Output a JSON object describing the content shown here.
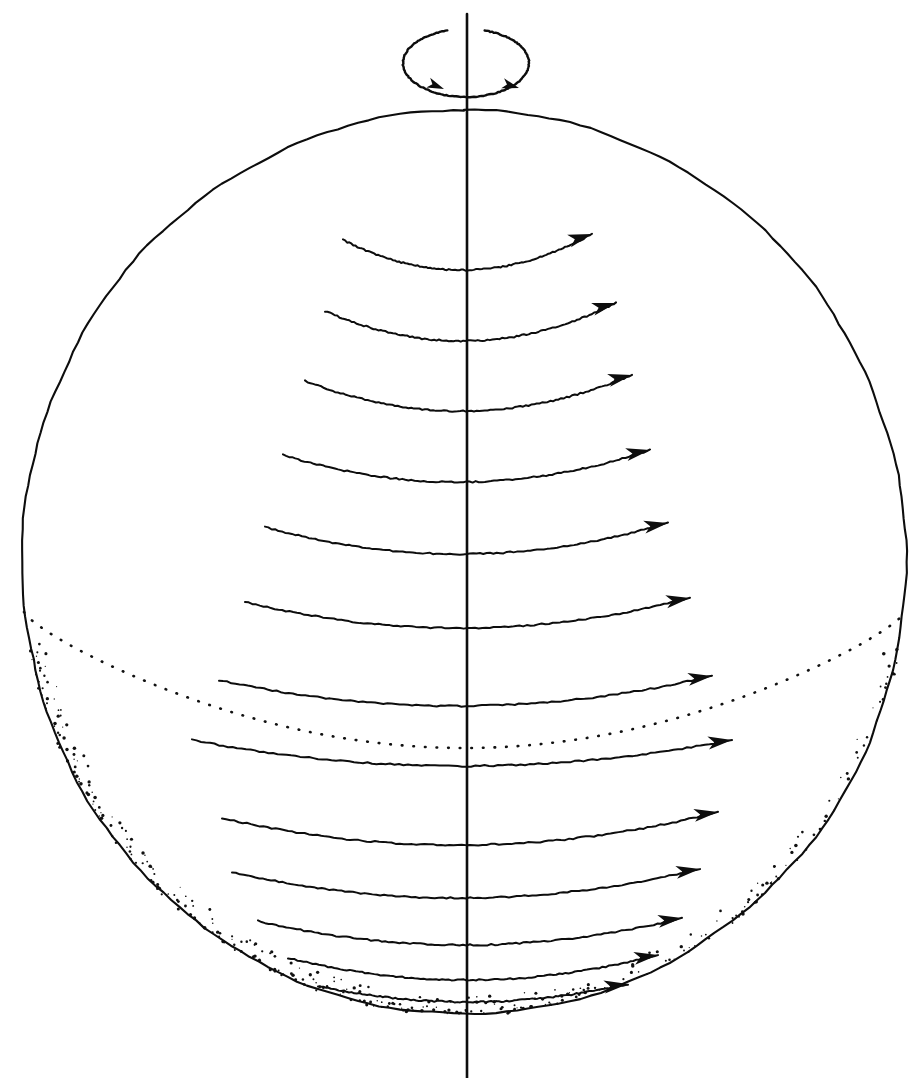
{
  "figure": {
    "title": "Rotating sphere with zonal (west-to-east) flow bands",
    "background_color": "#ffffff",
    "ink_color": "#0d0d0d",
    "width": 921,
    "height": 1078,
    "style": "hand-drawn line illustration"
  },
  "sphere": {
    "name": "sphere-outline",
    "center_x": 464,
    "center_y": 562,
    "radius_x": 442,
    "radius_y": 452,
    "top_y": 110,
    "bottom_y": 1014,
    "left_x": 22,
    "right_x": 906,
    "stroke_width": 2.1
  },
  "axis": {
    "name": "rotation-axis",
    "x": 467,
    "top_y": 14,
    "bottom_y": 1078,
    "label": "rotation axis"
  },
  "rotation_indicator": {
    "name": "rotation-ellipse",
    "center_x": 466,
    "center_y": 63,
    "radius_x": 63,
    "radius_y": 34,
    "direction": "counterclockwise-viewed-from-north",
    "arrow_count": 2,
    "arrows": [
      {
        "x": 444,
        "y": 89,
        "angle_deg": 22
      },
      {
        "x": 519,
        "y": 88,
        "angle_deg": 16
      }
    ],
    "gap_at_top": true
  },
  "equator": {
    "name": "equator-hidden-arc",
    "style": "dotted",
    "description": "back half of equator shown as dotted arc",
    "left_x": 24,
    "right_x": 905,
    "sag_y": 748,
    "end_y_left": 612,
    "end_y_right": 612
  },
  "shading": {
    "name": "limb-stipple",
    "description": "stippled texture hugging the inside of the lower-left and lower sphere limb",
    "dot_count": 420
  },
  "chart_data": {
    "type": "line",
    "xlabel": "",
    "ylabel": "",
    "series_count": 13,
    "arrow_direction": "eastward (to the right)",
    "bands": [
      {
        "index": 1,
        "latitude_label": "60N",
        "left_x": 343,
        "left_y": 240,
        "mid_x": 470,
        "mid_y": 270,
        "tip_x": 592,
        "tip_y": 234,
        "arrow_angle_deg": -17
      },
      {
        "index": 2,
        "latitude_label": "50N",
        "left_x": 325,
        "left_y": 311,
        "mid_x": 470,
        "mid_y": 341,
        "tip_x": 616,
        "tip_y": 303,
        "arrow_angle_deg": -15
      },
      {
        "index": 3,
        "latitude_label": "40N",
        "left_x": 305,
        "left_y": 381,
        "mid_x": 470,
        "mid_y": 411,
        "tip_x": 632,
        "tip_y": 375,
        "arrow_angle_deg": -13
      },
      {
        "index": 4,
        "latitude_label": "30N",
        "left_x": 283,
        "left_y": 455,
        "mid_x": 470,
        "mid_y": 482,
        "tip_x": 650,
        "tip_y": 450,
        "arrow_angle_deg": -11
      },
      {
        "index": 5,
        "latitude_label": "20N",
        "left_x": 265,
        "left_y": 527,
        "mid_x": 470,
        "mid_y": 554,
        "tip_x": 668,
        "tip_y": 523,
        "arrow_angle_deg": -10
      },
      {
        "index": 6,
        "latitude_label": "10N",
        "left_x": 245,
        "left_y": 602,
        "mid_x": 470,
        "mid_y": 628,
        "tip_x": 690,
        "tip_y": 598,
        "arrow_angle_deg": -9
      },
      {
        "index": 7,
        "latitude_label": "0",
        "left_x": 219,
        "left_y": 680,
        "mid_x": 470,
        "mid_y": 706,
        "tip_x": 712,
        "tip_y": 676,
        "arrow_angle_deg": -8
      },
      {
        "index": 8,
        "latitude_label": "10S",
        "left_x": 192,
        "left_y": 740,
        "mid_x": 470,
        "mid_y": 766,
        "tip_x": 732,
        "tip_y": 740,
        "arrow_angle_deg": -7
      },
      {
        "index": 9,
        "latitude_label": "20S",
        "left_x": 222,
        "left_y": 818,
        "mid_x": 470,
        "mid_y": 845,
        "tip_x": 718,
        "tip_y": 812,
        "arrow_angle_deg": -8
      },
      {
        "index": 10,
        "latitude_label": "30S",
        "left_x": 232,
        "left_y": 872,
        "mid_x": 470,
        "mid_y": 898,
        "tip_x": 700,
        "tip_y": 869,
        "arrow_angle_deg": -8
      },
      {
        "index": 11,
        "latitude_label": "40S",
        "left_x": 258,
        "left_y": 921,
        "mid_x": 470,
        "mid_y": 945,
        "tip_x": 682,
        "tip_y": 918,
        "arrow_angle_deg": -8
      },
      {
        "index": 12,
        "latitude_label": "50S",
        "left_x": 288,
        "left_y": 958,
        "mid_x": 470,
        "mid_y": 980,
        "tip_x": 658,
        "tip_y": 955,
        "arrow_angle_deg": -8
      },
      {
        "index": 13,
        "latitude_label": "60S",
        "left_x": 318,
        "left_y": 986,
        "mid_x": 470,
        "mid_y": 1002,
        "tip_x": 628,
        "tip_y": 984,
        "arrow_angle_deg": -7
      }
    ]
  }
}
